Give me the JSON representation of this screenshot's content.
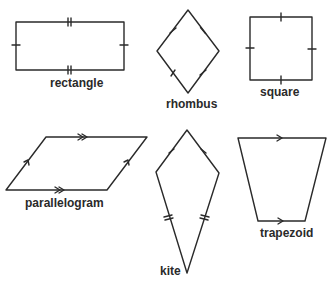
{
  "diagram": {
    "stroke_color": "#2a2a2a",
    "background": "#ffffff",
    "shapes": [
      {
        "name": "rectangle",
        "label": "rectangle",
        "markings": "opposite sides equal (single and double tick marks)"
      },
      {
        "name": "rhombus",
        "label": "rhombus",
        "markings": "all four sides equal (single tick marks)"
      },
      {
        "name": "square",
        "label": "square",
        "markings": "all four sides equal (single tick marks)"
      },
      {
        "name": "parallelogram",
        "label": "parallelogram",
        "markings": "opposite sides parallel (single and double arrows)"
      },
      {
        "name": "kite",
        "label": "kite",
        "markings": "two pairs of adjacent equal sides (single and double tick marks)"
      },
      {
        "name": "trapezoid",
        "label": "trapezoid",
        "markings": "one pair of parallel sides (single arrows)"
      }
    ]
  }
}
